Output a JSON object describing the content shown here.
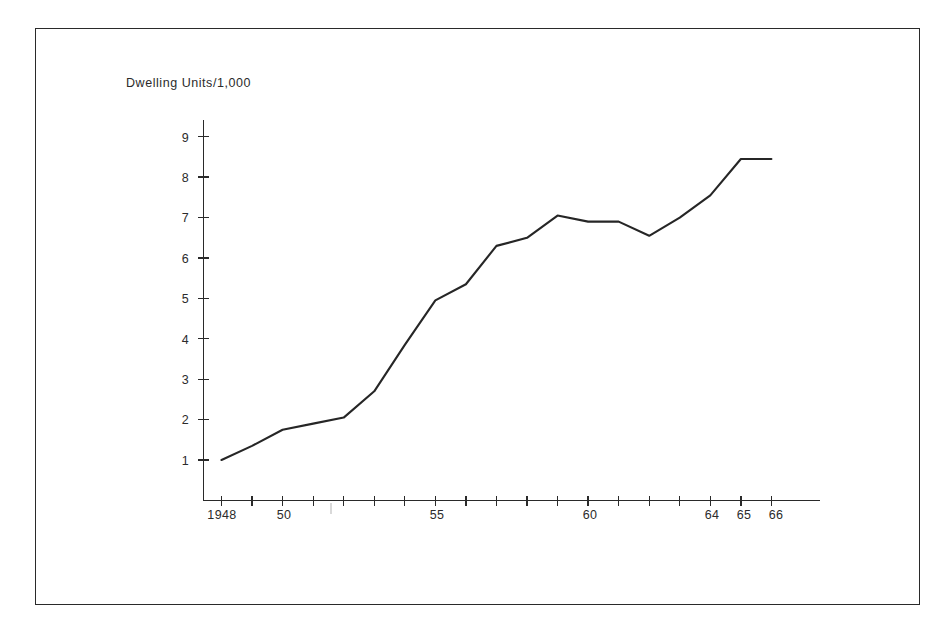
{
  "figure": {
    "title": "Dwelling Units/1,000",
    "background_color": "#ffffff",
    "line_color": "#262626",
    "axis_color": "#2a2a2a",
    "text_color": "#2b2b2b"
  },
  "chart_data": {
    "type": "line",
    "title": "Dwelling Units/1,000",
    "xlabel": "",
    "ylabel": "Dwelling Units/1,000",
    "grid": false,
    "legend": null,
    "xlim": [
      1948,
      1966
    ],
    "ylim": [
      0,
      9.6
    ],
    "x_tick_labels": [
      "1948",
      "50",
      "55",
      "60",
      "64",
      "65",
      "66"
    ],
    "x_tick_values": [
      1948,
      1950,
      1955,
      1960,
      1964,
      1965,
      1966
    ],
    "x_minor_ticks": [
      1948,
      1949,
      1950,
      1951,
      1952,
      1953,
      1954,
      1955,
      1956,
      1957,
      1958,
      1959,
      1960,
      1961,
      1962,
      1963,
      1964,
      1965,
      1966
    ],
    "y_tick_labels": [
      "1",
      "2",
      "3",
      "4",
      "5",
      "6",
      "7",
      "8",
      "9"
    ],
    "y_tick_values": [
      1,
      2,
      3,
      4,
      5,
      6,
      7,
      8,
      9
    ],
    "series": [
      {
        "name": "Dwelling Units per 1,000",
        "x": [
          1948,
          1949,
          1950,
          1951,
          1952,
          1953,
          1954,
          1955,
          1956,
          1957,
          1958,
          1959,
          1960,
          1961,
          1962,
          1963,
          1964,
          1965,
          1966
        ],
        "values": [
          1.0,
          1.35,
          1.75,
          1.9,
          2.05,
          2.7,
          3.85,
          4.95,
          5.35,
          6.3,
          6.5,
          7.05,
          6.9,
          6.9,
          6.55,
          7.0,
          7.55,
          8.45,
          8.45
        ]
      }
    ]
  },
  "axes": {
    "y_axis_name": "vertical-value-axis",
    "x_axis_name": "horizontal-year-axis"
  }
}
